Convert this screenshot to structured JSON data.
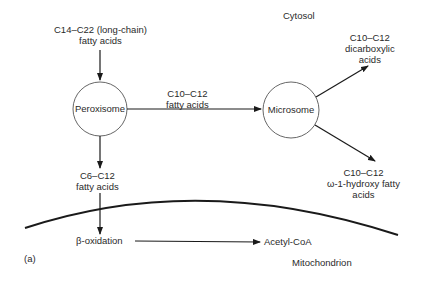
{
  "compartments": {
    "cytosol": "Cytosol",
    "mitochondrion": "Mitochondrion"
  },
  "nodes": {
    "peroxisome": "Peroxisome",
    "microsome": "Microsome"
  },
  "labels": {
    "long_chain": [
      "C14–C22 (long-chain)",
      "fatty acids"
    ],
    "c10_c12_fa": [
      "C10–C12",
      "fatty acids"
    ],
    "dicarboxylic": [
      "C10–C12",
      "dicarboxylic",
      "acids"
    ],
    "hydroxy": [
      "C10–C12",
      "ω-1-hydroxy fatty",
      "acids"
    ],
    "c6_c12": [
      "C6–C12",
      "fatty acids"
    ],
    "beta_ox": "β-oxidation",
    "acetyl_coa": "Acetyl-CoA"
  },
  "panel_label": "(a)",
  "colors": {
    "line": "#1a1a1a",
    "text": "#2a2a2a"
  }
}
